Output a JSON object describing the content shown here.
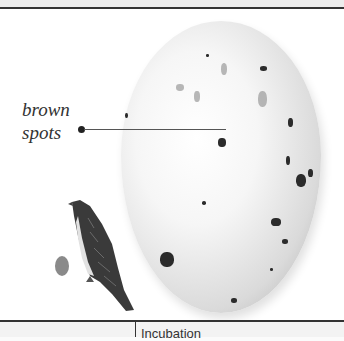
{
  "figure": {
    "annotation": {
      "label_line1": "brown",
      "label_line2": "spots"
    },
    "illustrations": [
      "large-egg",
      "small-bird",
      "small-egg"
    ]
  },
  "table": {
    "row_partial": {
      "left_cell": "",
      "right_cell": "Incubation"
    }
  }
}
